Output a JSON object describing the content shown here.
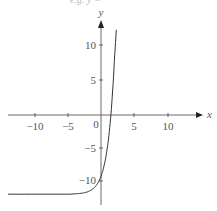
{
  "chart_data": {
    "type": "line",
    "title": "",
    "xlabel": "x",
    "ylabel": "y",
    "xlim": [
      -14,
      14
    ],
    "ylim": [
      -13.5,
      13
    ],
    "grid": false,
    "x_ticks": [
      -10,
      -5,
      0,
      5,
      10
    ],
    "y_ticks": [
      -10,
      -5,
      5,
      10
    ],
    "x_tick_labels": [
      "−10",
      "−5",
      "0",
      "5",
      "10"
    ],
    "y_tick_labels": [
      "−10",
      "−5",
      "5",
      "10"
    ],
    "series": [
      {
        "name": "exponential curve",
        "description": "Exponential growth curve with horizontal asymptote near y = -12, y-intercept about -9.3, x-intercept about 1.5",
        "x": [
          -14,
          -10,
          -6,
          -4,
          -3,
          -2,
          -1,
          0,
          0.5,
          1,
          1.5,
          2,
          2.3
        ],
        "y": [
          -12,
          -12,
          -12,
          -11.95,
          -11.86,
          -11.63,
          -11,
          -9.28,
          -7.52,
          -4.61,
          0.18,
          8.09,
          12.9
        ]
      }
    ],
    "annotations": []
  },
  "fragment_text": "e.g. y ="
}
